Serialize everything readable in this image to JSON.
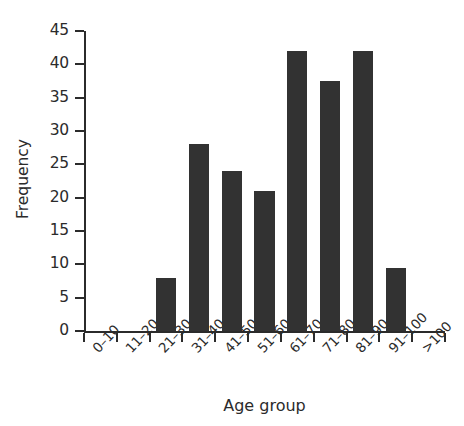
{
  "chart_data": {
    "type": "bar",
    "title": "",
    "xlabel": "Age group",
    "ylabel": "Frequency",
    "categories": [
      "0–10",
      "11–20",
      "21–30",
      "31–40",
      "41–50",
      "51–60",
      "61–70",
      "71–80",
      "81–90",
      "91–100",
      ">100"
    ],
    "values": [
      0,
      0,
      8,
      28,
      24,
      21,
      42,
      37.5,
      42,
      9.5,
      0
    ],
    "ylim": [
      0,
      45
    ],
    "y_ticks": [
      0,
      5,
      10,
      15,
      20,
      25,
      30,
      35,
      40,
      45
    ],
    "y_tick_labels": [
      "0",
      "5",
      "10",
      "15",
      "20",
      "25",
      "30",
      "35",
      "40",
      "45"
    ],
    "grid": false,
    "legend": false,
    "bar_color": "#323232",
    "axis_color": "#2b2b2b",
    "background": "#ffffff",
    "x_tick_label_rotation": -47
  }
}
